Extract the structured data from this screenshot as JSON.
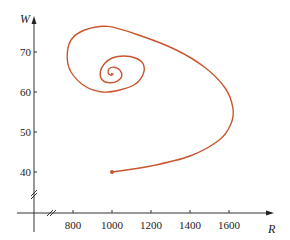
{
  "chart_data": {
    "type": "line",
    "title": "",
    "xlabel": "R",
    "ylabel": "W",
    "xlim": [
      600,
      1800
    ],
    "ylim": [
      30,
      78
    ],
    "x_ticks": [
      800,
      1000,
      1200,
      1400,
      1600
    ],
    "y_ticks": [
      40,
      50,
      60,
      70
    ],
    "x_tick_labels": [
      "800",
      "1000",
      "1200",
      "1400",
      "1600"
    ],
    "y_tick_labels": [
      "40",
      "50",
      "60",
      "70"
    ],
    "axis_breaks": {
      "x": true,
      "y": true
    },
    "grid": false,
    "legend": null,
    "series": [
      {
        "name": "phase trajectory",
        "color": "#c8562e",
        "start_point": {
          "R": 1000,
          "W": 40
        },
        "R": [
          1000,
          1200,
          1400,
          1550,
          1610,
          1620,
          1580,
          1480,
          1330,
          1150,
          980,
          860,
          790,
          770,
          790,
          860,
          950,
          1040,
          1120,
          1160,
          1160,
          1120,
          1060,
          1000,
          960,
          940,
          950,
          990,
          1030,
          1050,
          1040,
          1010,
          985,
          980,
          995,
          1005,
          995
        ],
        "W": [
          40,
          41.5,
          44,
          48,
          52,
          56,
          61,
          66,
          70.5,
          74,
          76.4,
          75.5,
          73,
          68.75,
          65,
          61.5,
          60,
          60.5,
          62,
          64.5,
          67,
          68.5,
          69,
          68.5,
          67,
          65,
          63,
          62.3,
          62.8,
          64,
          65.5,
          66.2,
          65.8,
          64.8,
          64.2,
          64.5,
          64.6
        ]
      }
    ]
  }
}
